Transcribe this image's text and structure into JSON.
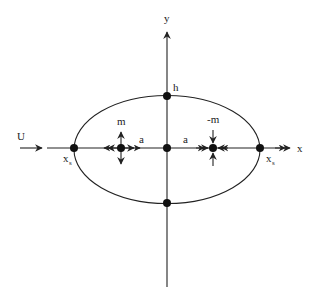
{
  "diagram": {
    "labels": {
      "y_axis": "y",
      "x_axis": "x",
      "uniform_flow": "U",
      "source": "m",
      "sink": "-m",
      "half_distance_left": "a",
      "half_distance_right": "a",
      "height": "h",
      "stagnation_left": "x",
      "stagnation_left_sub": "s",
      "stagnation_right": "x",
      "stagnation_right_sub": "s"
    },
    "elements": [
      {
        "type": "axis",
        "name": "x-axis",
        "label": "x"
      },
      {
        "type": "axis",
        "name": "y-axis",
        "label": "y"
      },
      {
        "type": "oval",
        "name": "rankine-oval",
        "center": [
          167,
          149
        ],
        "rx": 93,
        "ry": 54
      },
      {
        "type": "point",
        "name": "source",
        "label": "m",
        "position": [
          121,
          148
        ],
        "arrows": "outward"
      },
      {
        "type": "point",
        "name": "sink",
        "label": "-m",
        "position": [
          213,
          148
        ],
        "arrows": "inward"
      },
      {
        "type": "point",
        "name": "stagnation-left",
        "label": "xs",
        "position": [
          74,
          148
        ]
      },
      {
        "type": "point",
        "name": "stagnation-right",
        "label": "xs",
        "position": [
          260,
          148
        ]
      },
      {
        "type": "point",
        "name": "origin",
        "position": [
          167,
          148
        ]
      },
      {
        "type": "point",
        "name": "top",
        "label": "h",
        "position": [
          167,
          96
        ]
      },
      {
        "type": "point",
        "name": "bottom",
        "position": [
          167,
          203
        ]
      },
      {
        "type": "arrow",
        "name": "uniform-flow-arrow",
        "label": "U"
      }
    ],
    "colors": {
      "stroke": "#222222",
      "background": "#ffffff"
    }
  }
}
